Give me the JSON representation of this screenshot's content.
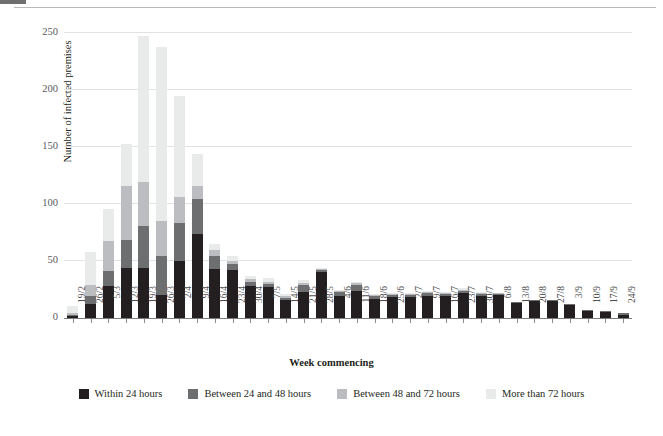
{
  "chart_data": {
    "type": "bar",
    "stacked": true,
    "title": "",
    "xlabel": "Week commencing",
    "ylabel": "Number of infected premises",
    "ylim": [
      0,
      250
    ],
    "yticks": [
      0,
      50,
      100,
      150,
      200,
      250
    ],
    "grid": true,
    "legend_position": "bottom",
    "categories": [
      "19/2",
      "26/2",
      "5/3",
      "12/3",
      "19/3",
      "26/3",
      "2/4",
      "9/4",
      "16/4",
      "23/4",
      "30/4",
      "7/5",
      "14/5",
      "21/5",
      "28/5",
      "4/6",
      "11/6",
      "18/6",
      "25/6",
      "2/7",
      "9/7",
      "16/7",
      "23/7",
      "30/7",
      "6/8",
      "13/8",
      "20/8",
      "27/8",
      "3/9",
      "10/9",
      "17/9",
      "24/9"
    ],
    "series": [
      {
        "name": "Within 24 hours",
        "color": "#231f20",
        "values": [
          2,
          12,
          28,
          44,
          44,
          20,
          50,
          74,
          43,
          42,
          28,
          27,
          16,
          23,
          40,
          19,
          24,
          17,
          18,
          18,
          19,
          19,
          22,
          19,
          20,
          13,
          15,
          15,
          11,
          6,
          5,
          3
        ]
      },
      {
        "name": "Between 24 and 48 hours",
        "color": "#6d6e70",
        "values": [
          1,
          7,
          13,
          24,
          37,
          34,
          33,
          30,
          11,
          5,
          4,
          3,
          2,
          6,
          2,
          4,
          5,
          2,
          2,
          2,
          3,
          2,
          2,
          2,
          1,
          1,
          1,
          1,
          1,
          1,
          1,
          1
        ]
      },
      {
        "name": "Between 48 and 72 hours",
        "color": "#bcbdc0",
        "values": [
          1,
          10,
          27,
          48,
          38,
          31,
          23,
          12,
          6,
          3,
          2,
          2,
          1,
          2,
          1,
          1,
          2,
          1,
          1,
          1,
          1,
          1,
          1,
          1,
          1,
          0,
          0,
          0,
          0,
          0,
          0,
          0
        ]
      },
      {
        "name": "More than 72 hours",
        "color": "#e9eaea",
        "values": [
          7,
          29,
          28,
          37,
          128,
          153,
          89,
          28,
          5,
          4,
          3,
          3,
          2,
          2,
          1,
          1,
          1,
          1,
          1,
          1,
          1,
          1,
          1,
          1,
          0,
          0,
          0,
          0,
          0,
          0,
          0,
          0
        ]
      }
    ]
  },
  "legend": {
    "items": [
      {
        "label": "Within 24 hours"
      },
      {
        "label": "Between 24 and 48 hours"
      },
      {
        "label": "Between 48 and 72 hours"
      },
      {
        "label": "More than 72 hours"
      }
    ]
  }
}
